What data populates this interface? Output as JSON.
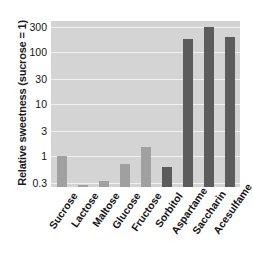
{
  "chart_data": {
    "type": "bar",
    "title": "",
    "subtitle": "",
    "xlabel": "",
    "ylabel": "Relative sweetness (sucrose = 1)",
    "yscale": "log",
    "ylim": [
      0.25,
      400
    ],
    "ytick_labels": [
      "300",
      "100",
      "30",
      "10",
      "3",
      "1",
      "0.3"
    ],
    "ytick_values": [
      300,
      100,
      30,
      10,
      3,
      1,
      0.3
    ],
    "grid": true,
    "legend": "none",
    "categories": [
      "Sucrose",
      "Lactose",
      "Maltose",
      "Glucose",
      "Fructose",
      "Sorbitol",
      "Aspartame",
      "Saccharin",
      "Acesulfame"
    ],
    "values": [
      1,
      0.16,
      0.33,
      0.7,
      1.5,
      0.6,
      180,
      300,
      200
    ],
    "bar_groups": [
      "sugar",
      "sugar",
      "sugar",
      "sugar",
      "sugar",
      "alt",
      "alt",
      "alt",
      "alt"
    ],
    "colors": {
      "sugar_bar": "#a0a0a0",
      "alt_bar": "#5c5c5c",
      "plot_background": "#d4d4d4",
      "gridline": "#f2f2f2",
      "text": "#141414"
    }
  }
}
